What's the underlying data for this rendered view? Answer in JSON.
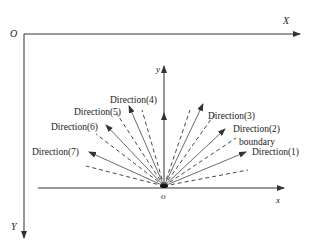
{
  "diagram": {
    "outer_axes": {
      "origin_label": "O",
      "x_label": "X",
      "y_label": "Y"
    },
    "inner_axes": {
      "origin_label": "o",
      "x_label": "x",
      "y_label": "y"
    },
    "directions": [
      {
        "label": "Direction(1)"
      },
      {
        "label": "Direction(2)"
      },
      {
        "label": "Direction(3)"
      },
      {
        "label": "Direction(4)"
      },
      {
        "label": "Direction(5)"
      },
      {
        "label": "Direction(6)"
      },
      {
        "label": "Direction(7)"
      }
    ],
    "boundary_label": "boundary",
    "colors": {
      "line": "#333333",
      "text": "#222222",
      "background": "#ffffff"
    }
  }
}
